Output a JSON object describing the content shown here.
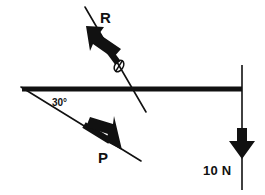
{
  "figure": {
    "name": "force-diagram",
    "type": "free-body-diagram",
    "width": 265,
    "height": 195,
    "background_color": "#ffffff",
    "stroke_color": "#111111"
  },
  "beam": {
    "label": "horizontal-beam",
    "x1": 22,
    "y1": 89,
    "x2": 242,
    "y2": 89,
    "thickness": 5
  },
  "forces": [
    {
      "id": "R",
      "label": "R",
      "label_x": 100,
      "label_y": 23,
      "direction": "up-left",
      "line_x1": 85,
      "line_y1": 7,
      "line_x2": 146,
      "line_y2": 112,
      "arrow_tip_x": 88,
      "arrow_tip_y": 29
    },
    {
      "id": "P",
      "label": "P",
      "label_x": 98,
      "label_y": 163,
      "direction": "down-right",
      "line_x1": 22,
      "line_y1": 89,
      "line_x2": 141,
      "line_y2": 161,
      "arrow_tip_x": 117,
      "arrow_tip_y": 146
    },
    {
      "id": "W",
      "label": "10 N",
      "label_x": 203,
      "label_y": 175,
      "direction": "down",
      "line_x1": 242,
      "line_y1": 65,
      "line_x2": 242,
      "line_y2": 190,
      "arrow_tip_x": 242,
      "arrow_tip_y": 157
    }
  ],
  "angles": [
    {
      "id": "beam-angle",
      "label": "30°",
      "label_x": 52,
      "label_y": 106
    },
    {
      "id": "reaction-angle",
      "label": "θ",
      "label_x": 113,
      "label_y": 70,
      "rotation": -60
    }
  ]
}
